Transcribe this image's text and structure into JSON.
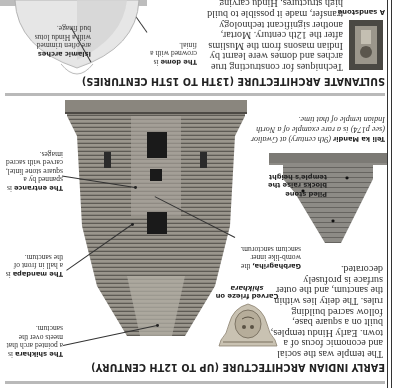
{
  "page": {
    "orientation": "rotated 180 degrees",
    "sections": [
      {
        "heading": "EARLY INDIAN ARCHITECTURE (UP TO 12TH CENTURY)",
        "body": "The temple was the social and economic focus of a town. Early Hindu temples, built on a square base, follow sacred building rules. The deity lies within the sanctum, and the outer surface is profusely decorated.",
        "frieze_caption": {
          "title": "Carved frieze on",
          "title2": "shikhara"
        },
        "labels": {
          "shikhara": {
            "title": "The shikhara",
            "text": " is a pointed arch that meets over the sanctum."
          },
          "mandapa": {
            "title": "The mandapa",
            "text": " is a hall in front of the sanctum."
          },
          "entrance": {
            "title": "The entrance",
            "text": " is spanned by a square stone lintel, carved with sacred images."
          },
          "garbhagriha": {
            "title": "Garbhagriha,",
            "text": " the womb-like inner sanctum sanctorum."
          },
          "piled_stone": {
            "title": "Piled stone blocks raise the temple's height"
          }
        },
        "teli": {
          "title": "Teli ka Mandir",
          "text": " (9th century) at Gwalior (see p174) is a rare example of a North Indian temple of that time."
        }
      },
      {
        "heading": "SULTANATE ARCHITECTURE (13TH TO 15TH CENTURIES)",
        "body": "Techniques for constructing true arches and domes were learnt by Indian masons from the Muslims after the 12th century. Mortar, another significant technology transfer, made it possible to build high structures. Hindu carving skills",
        "sandstone_caption": "A sandstone",
        "labels": {
          "dome": {
            "title": "The dome",
            "text": " is crowned with a finial."
          },
          "arches": {
            "title": "Islamic arches",
            "text": " are often trimmed with a Hindu lotus bud finage."
          }
        }
      }
    ]
  }
}
